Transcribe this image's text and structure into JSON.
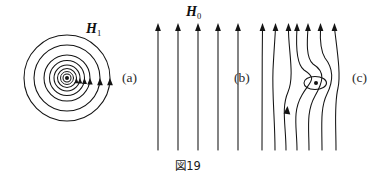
{
  "figure": {
    "caption": "図19",
    "background_color": "#ffffff",
    "ink_color": "#141414",
    "width": 377,
    "height": 177,
    "panels": [
      {
        "id": "a",
        "label": "(a)",
        "label_x": 122,
        "label_y": 82,
        "field_label": "H",
        "field_label_subscript": "1",
        "field_label_x": 86,
        "field_label_y": 33,
        "description": "concentric circular field lines around an out-of-page current, counterclockwise arrowheads on the right side",
        "center_x": 67,
        "center_y": 78,
        "circle_radii": [
          43,
          33,
          23,
          17.5,
          13,
          9.5,
          6.5,
          4
        ],
        "center_dot_radius": 2.0,
        "center_ring_radius": 4.0,
        "arrow_radii": [
          43,
          33,
          23,
          17.5,
          13,
          9.5
        ]
      },
      {
        "id": "b",
        "label": "(b)",
        "label_x": 234,
        "label_y": 82,
        "field_label": "H",
        "field_label_subscript": "0",
        "field_label_x": 186,
        "field_label_y": 16,
        "description": "uniform vertical field: five straight parallel arrows pointing up",
        "line_count": 5,
        "line_xs": [
          158,
          178,
          198,
          218,
          238
        ],
        "line_top_y": 25,
        "line_bottom_y": 150
      },
      {
        "id": "c",
        "label": "(c)",
        "label_x": 352,
        "label_y": 82,
        "description": "superposed field: seven curved field lines deflected around a vortex; small closed loop with an out-of-page dot at the neutral point",
        "line_count": 7,
        "line_top_y": 25,
        "line_bottom_y": 150,
        "vortex_center_x": 315,
        "vortex_center_y": 83,
        "vortex_loop_rx": 11,
        "vortex_loop_ry": 7,
        "vortex_dot_radius": 2.0,
        "mid_arrow_x": 290,
        "mid_arrow_y": 113
      }
    ]
  }
}
